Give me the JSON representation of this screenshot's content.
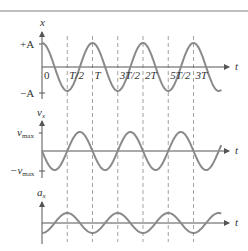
{
  "figure": {
    "type": "shm-graphs",
    "colors": {
      "curve": "#8a8a8a",
      "axis": "#555555",
      "dashed": "#8a8a8a",
      "text": "#333333",
      "top_rule": "#aaaaaa"
    },
    "time_ticks": [
      "0",
      "T/2",
      "T",
      "3T/2",
      "2T",
      "5T/2",
      "3T"
    ],
    "panels": [
      {
        "name": "position",
        "y_label": "x",
        "x_label": "t",
        "pos_label": "+A",
        "neg_label": "−A",
        "function": "cos"
      },
      {
        "name": "velocity",
        "y_label": "v",
        "y_label_sub": "x",
        "x_label": "t",
        "pos_label": "v",
        "pos_label_sub": "max",
        "neg_label": "−v",
        "neg_label_sub": "max",
        "function": "-sin"
      },
      {
        "name": "acceleration",
        "y_label": "a",
        "y_label_sub": "x",
        "x_label": "t",
        "function": "-cos"
      }
    ]
  }
}
